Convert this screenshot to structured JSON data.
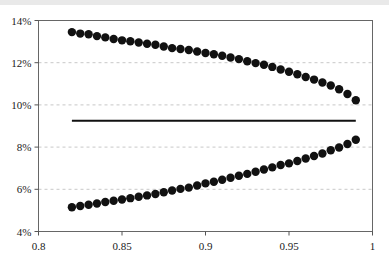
{
  "chart_data": {
    "type": "scatter",
    "title": "",
    "subtitle": "",
    "xlabel": "",
    "ylabel": "",
    "xlim": [
      0.8,
      1.0
    ],
    "ylim": [
      0.04,
      0.14
    ],
    "grid": true,
    "grid_axis": "y",
    "legend": "none",
    "xticks": [
      0.8,
      0.85,
      0.9,
      0.95,
      1
    ],
    "xticklabels": [
      "0.8",
      "0.85",
      "0.9",
      "0.95",
      "1"
    ],
    "yticks": [
      0.04,
      0.06,
      0.08,
      0.1,
      0.12,
      0.14
    ],
    "yticklabels": [
      "4%",
      "6%",
      "8%",
      "10%",
      "12%",
      "14%"
    ],
    "marker": "filled-circle",
    "marker_color": "#111111",
    "marker_size": 4.2,
    "series": [
      {
        "name": "upper-bound-series",
        "type": "scatter",
        "color": "#111111",
        "x": [
          0.82,
          0.825,
          0.83,
          0.835,
          0.84,
          0.845,
          0.85,
          0.855,
          0.86,
          0.865,
          0.87,
          0.875,
          0.88,
          0.885,
          0.89,
          0.895,
          0.9,
          0.905,
          0.91,
          0.915,
          0.92,
          0.925,
          0.93,
          0.935,
          0.94,
          0.945,
          0.95,
          0.955,
          0.96,
          0.965,
          0.97,
          0.975,
          0.98,
          0.985,
          0.99
        ],
        "values": [
          0.1345,
          0.1338,
          0.1335,
          0.1326,
          0.132,
          0.1312,
          0.1306,
          0.1302,
          0.1296,
          0.129,
          0.1285,
          0.1277,
          0.1269,
          0.1265,
          0.126,
          0.1253,
          0.1246,
          0.124,
          0.1233,
          0.1225,
          0.1217,
          0.1207,
          0.1198,
          0.119,
          0.118,
          0.1168,
          0.1157,
          0.1145,
          0.1132,
          0.112,
          0.1106,
          0.1092,
          0.1074,
          0.1052,
          0.1022
        ]
      },
      {
        "name": "lower-bound-series",
        "type": "scatter",
        "color": "#111111",
        "x": [
          0.82,
          0.825,
          0.83,
          0.835,
          0.84,
          0.845,
          0.85,
          0.855,
          0.86,
          0.865,
          0.87,
          0.875,
          0.88,
          0.885,
          0.89,
          0.895,
          0.9,
          0.905,
          0.91,
          0.915,
          0.92,
          0.925,
          0.93,
          0.935,
          0.94,
          0.945,
          0.95,
          0.955,
          0.96,
          0.965,
          0.97,
          0.975,
          0.98,
          0.985,
          0.99
        ],
        "values": [
          0.0515,
          0.0521,
          0.0527,
          0.0533,
          0.054,
          0.0546,
          0.0552,
          0.0558,
          0.0565,
          0.0571,
          0.0578,
          0.0586,
          0.0594,
          0.0602,
          0.0608,
          0.0618,
          0.0628,
          0.0636,
          0.0645,
          0.0655,
          0.0664,
          0.0673,
          0.0683,
          0.0694,
          0.0704,
          0.0715,
          0.0723,
          0.0734,
          0.0746,
          0.0758,
          0.077,
          0.0785,
          0.0798,
          0.0815,
          0.0835
        ]
      }
    ],
    "reference_line": {
      "name": "horizontal-reference-line",
      "orientation": "horizontal",
      "value": 0.0925,
      "x_start": 0.82,
      "x_end": 0.99,
      "color": "#111111",
      "style": "solid",
      "width": 2
    },
    "colors": {
      "marker": "#111111",
      "reference_line": "#111111",
      "gridline": "#c8c8c8",
      "axis": "#555555",
      "frame": "#666666",
      "tick_text": "#1a1a1a",
      "top_band": "#e9e9e9",
      "background": "#ffffff"
    }
  }
}
